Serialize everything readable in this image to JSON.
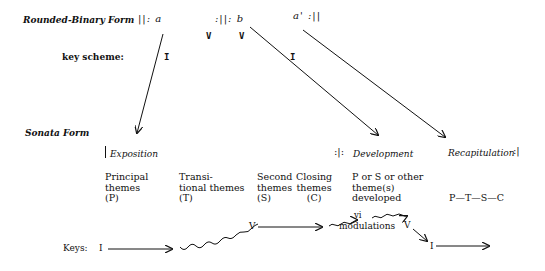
{
  "rounded_binary": {
    "title": "Rounded-Binary Form",
    "section_a": "||: a",
    "section_b": ":||: b",
    "section_a_prime": "a' :||",
    "b_keys": [
      "V",
      "V"
    ],
    "key_scheme_label": "key scheme:",
    "key_a": "I",
    "key_a_prime": "I"
  },
  "sonata": {
    "title": "Sonata Form",
    "sections": {
      "exposition": "Exposition",
      "development_repeat": ":|:",
      "development": "Development",
      "recapitulation": "Recapitulation",
      "recap_repeat": ":|"
    },
    "columns": [
      {
        "lines": [
          "Principal",
          "themes",
          "(P)"
        ]
      },
      {
        "lines": [
          "Transi-",
          "tional themes",
          "(T)"
        ]
      },
      {
        "lines": [
          "Second",
          "themes",
          "(S)"
        ]
      },
      {
        "lines": [
          "Closing",
          "themes",
          "(C)"
        ]
      },
      {
        "lines": [
          "P or S or other",
          "theme(s)",
          "developed"
        ]
      },
      {
        "lines": [
          "P—T—S—C"
        ]
      }
    ],
    "keys": {
      "label": "Keys:",
      "start": "I",
      "dominant": "V",
      "vi": "vi",
      "modulations": "modulations",
      "dominant_2": "V",
      "tonic_return": "I"
    }
  }
}
